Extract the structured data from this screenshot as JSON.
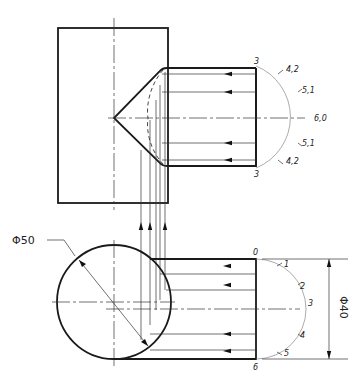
{
  "drawing": {
    "title": "Intersection of cone-tipped cylinder with vertical cylinder",
    "dimensions": {
      "large_diameter": "Φ50",
      "small_diameter": "Φ40"
    },
    "upper_view_labels": {
      "top": "3",
      "bottom": "3",
      "r1": "4,2",
      "r2": "5,1",
      "r3": "6,0",
      "r4": "5,1",
      "r5": "4,2"
    },
    "lower_view_labels": {
      "top": "0",
      "bottom": "6",
      "p1": "1",
      "p2": "2",
      "p3": "3",
      "p4": "4",
      "p5": "5"
    }
  }
}
